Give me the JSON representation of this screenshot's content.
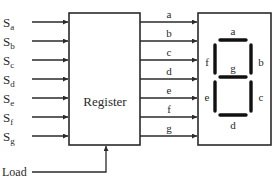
{
  "register": {
    "label": "Register"
  },
  "inputs": [
    {
      "main": "S",
      "sub": "a"
    },
    {
      "main": "S",
      "sub": "b"
    },
    {
      "main": "S",
      "sub": "c"
    },
    {
      "main": "S",
      "sub": "d"
    },
    {
      "main": "S",
      "sub": "e"
    },
    {
      "main": "S",
      "sub": "f"
    },
    {
      "main": "S",
      "sub": "g"
    }
  ],
  "outputs": [
    "a",
    "b",
    "c",
    "d",
    "e",
    "f",
    "g"
  ],
  "load": {
    "label": "Load"
  },
  "display": {
    "segments": {
      "a": "a",
      "b": "b",
      "c": "c",
      "d": "d",
      "e": "e",
      "f": "f",
      "g": "g"
    }
  },
  "colors": {
    "line": "#2a2a2a",
    "segment": "#111111",
    "background": "#ffffff"
  }
}
